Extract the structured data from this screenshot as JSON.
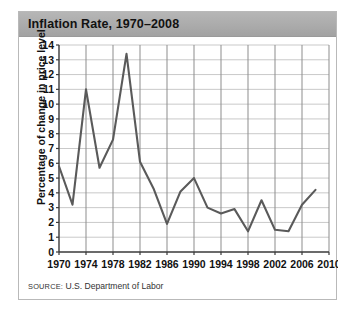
{
  "figure": {
    "title": "Inflation Rate, 1970–2008",
    "source_label": "SOURCE:",
    "source_text": " U.S. Department of Labor"
  },
  "colors": {
    "title_bar": "#ababab",
    "line": "#5a5a5a",
    "grid_vertical": "#8d8d8d",
    "grid_horizontal": "#c9c9c9",
    "axis": "#3a3a3a",
    "border": "#b9b9b9"
  },
  "chart_data": {
    "type": "line",
    "title": "Inflation Rate, 1970–2008",
    "xlabel": "",
    "ylabel": "Percentage of change in price level",
    "xlim": [
      1970,
      2010
    ],
    "ylim": [
      0,
      14
    ],
    "xticks": [
      1970,
      1974,
      1978,
      1982,
      1986,
      1990,
      1994,
      1998,
      2002,
      2006,
      2010
    ],
    "xtick_labels": [
      "1970",
      "1974",
      "1978",
      "1982",
      "1986",
      "1990",
      "1994",
      "1998",
      "2002",
      "2006",
      "2010"
    ],
    "yticks": [
      0,
      1,
      2,
      3,
      4,
      5,
      6,
      7,
      8,
      9,
      10,
      11,
      12,
      13,
      14
    ],
    "ytick_labels": [
      "0",
      "1",
      "2",
      "3",
      "4",
      "5",
      "6",
      "7",
      "8",
      "9",
      "10",
      "11",
      "12",
      "13",
      "14"
    ],
    "grid": true,
    "legend": false,
    "x": [
      1970,
      1972,
      1974,
      1976,
      1978,
      1980,
      1982,
      1984,
      1986,
      1988,
      1990,
      1992,
      1994,
      1996,
      1998,
      2000,
      2002,
      2004,
      2006,
      2008
    ],
    "values": [
      5.8,
      3.2,
      11.0,
      5.7,
      7.6,
      13.4,
      6.1,
      4.3,
      1.9,
      4.1,
      5.0,
      3.0,
      2.6,
      2.9,
      1.4,
      3.5,
      1.5,
      1.4,
      3.2,
      4.2
    ]
  }
}
